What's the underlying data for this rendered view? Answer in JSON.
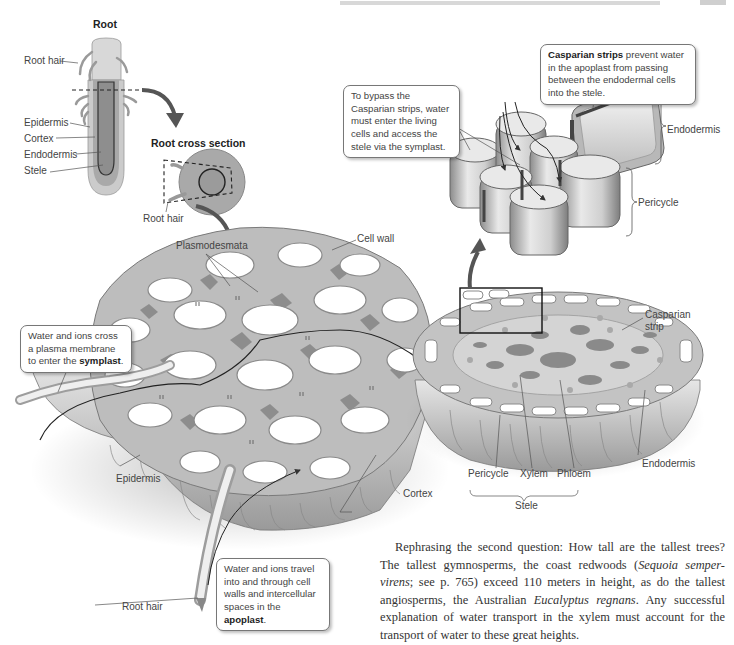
{
  "header": {
    "running_head": "",
    "page_number": ""
  },
  "longitudinal_root": {
    "title": "Root",
    "labels": [
      "Root hair",
      "Epidermis",
      "Cortex",
      "Endodermis",
      "Stele"
    ]
  },
  "cross_section": {
    "title": "Root cross section",
    "labels": [
      "Root hair"
    ]
  },
  "cortex_block": {
    "labels": {
      "plasmodesmata": "Plasmodesmata",
      "cell_wall": "Cell wall",
      "epidermis": "Epidermis",
      "root_hair": "Root hair",
      "cortex": "Cortex"
    }
  },
  "stele_block": {
    "labels": {
      "casparian_strip": "Casparian strip",
      "endodermis": "Endodermis",
      "pericycle": "Pericycle",
      "xylem": "Xylem",
      "phloem": "Phloem",
      "stele": "Stele"
    }
  },
  "endodermis_detail": {
    "labels": {
      "endodermis": "Endodermis",
      "pericycle": "Pericycle"
    }
  },
  "callouts": {
    "symplast": {
      "text": "Water and ions cross a plasma membrane to enter the ",
      "bold": "symplast",
      "tail": "."
    },
    "apoplast": {
      "text": "Water and ions travel into and through cell walls and intercellular spaces in the ",
      "bold": "apoplast",
      "tail": "."
    },
    "bypass": {
      "text": "To bypass the Casparian strips, water must enter the living cells and access the stele via the symplast."
    },
    "casparian": {
      "bold": "Casparian strips",
      "text": " prevent water in the apoplast from passing between the endodermal cells into the stele."
    }
  },
  "prose": {
    "p1_a": "Rephrasing the second question: How tall are the tallest trees? The tallest gymnosperms, the coast redwoods (",
    "p1_i1": "Sequoia semper-virens",
    "p1_b": "; see p. 765) exceed 110 meters in height, as do the tallest angiosperms, the Australian ",
    "p1_i2": "Eucalyptus regnans",
    "p1_c": ". Any successful explanation of water transport in the xylem must account for the transport of water to these great heights."
  },
  "colors": {
    "cell_wall": "#b5b5b5",
    "cell_fill": "#ffffff",
    "intercellular": "#8f8f8f",
    "tissue_dark": "#9a9a9a",
    "casparian_band": "#555555",
    "arrow": "#555555"
  }
}
